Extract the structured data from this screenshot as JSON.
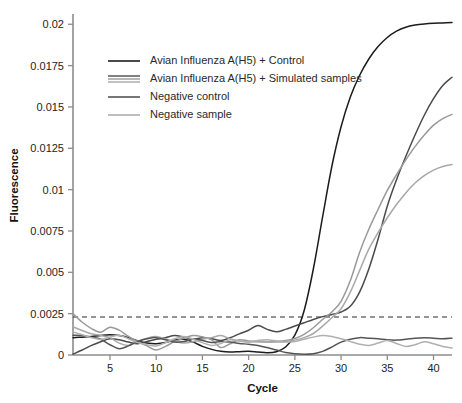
{
  "chart_data": {
    "type": "line",
    "title": "",
    "xlabel": "Cycle",
    "ylabel": "Fluorescence",
    "xlim": [
      1,
      42
    ],
    "ylim": [
      0,
      0.0205
    ],
    "xticks": [
      5,
      10,
      15,
      20,
      25,
      30,
      35,
      40
    ],
    "yticks": [
      0,
      0.0025,
      0.005,
      0.0075,
      0.01,
      0.0125,
      0.015,
      0.0175,
      0.02
    ],
    "ytick_labels": [
      "0",
      "0.0025",
      "0.005",
      "0.0075",
      "0.01",
      "0.0125",
      "0.015",
      "0.0175",
      "0.02"
    ],
    "xtick_labels": [
      "5",
      "10",
      "15",
      "20",
      "25",
      "30",
      "35",
      "40"
    ],
    "grid": false,
    "legend_position": "upper-left-inside",
    "threshold": {
      "label": "threshold",
      "value": 0.0023,
      "style": "dashed",
      "color": "#2b2b2b"
    },
    "x": [
      1,
      2,
      3,
      4,
      5,
      6,
      7,
      8,
      9,
      10,
      11,
      12,
      13,
      14,
      15,
      16,
      17,
      18,
      19,
      20,
      21,
      22,
      23,
      24,
      25,
      26,
      27,
      28,
      29,
      30,
      31,
      32,
      33,
      34,
      35,
      36,
      37,
      38,
      39,
      40,
      41,
      42
    ],
    "series": [
      {
        "name": "Avian Influenza A(H5) + Control",
        "group": "positive-control",
        "color": "#1c1c1c",
        "values": [
          0.00105,
          0.00108,
          0.00112,
          0.00118,
          0.00122,
          0.00118,
          0.00105,
          0.00085,
          0.00072,
          0.00068,
          0.00075,
          0.0009,
          0.00095,
          0.00078,
          0.00052,
          0.00034,
          0.00022,
          0.00018,
          0.0002,
          0.00022,
          0.00018,
          0.00014,
          0.0002,
          0.00048,
          0.0012,
          0.00268,
          0.0052,
          0.00835,
          0.0114,
          0.0138,
          0.0156,
          0.0169,
          0.0179,
          0.01865,
          0.0192,
          0.01958,
          0.01982,
          0.01995,
          0.02002,
          0.02006,
          0.02008,
          0.0201
        ]
      },
      {
        "name": "Avian Influenza A(H5) + Simulated sample 1",
        "group": "simulated-samples",
        "color": "#4a4a4a",
        "values": [
          5e-05,
          0.0003,
          0.00058,
          0.0008,
          0.00098,
          0.00092,
          0.00078,
          0.00068,
          0.00082,
          0.00095,
          0.00105,
          0.00118,
          0.00108,
          0.00095,
          0.00105,
          0.00098,
          0.00088,
          0.00105,
          0.00128,
          0.0015,
          0.00178,
          0.00155,
          0.0014,
          0.00155,
          0.00175,
          0.00195,
          0.00215,
          0.00232,
          0.00245,
          0.0026,
          0.00295,
          0.0038,
          0.0052,
          0.007,
          0.009,
          0.0106,
          0.012,
          0.0133,
          0.0145,
          0.0155,
          0.0163,
          0.0168
        ]
      },
      {
        "name": "Avian Influenza A(H5) + Simulated sample 2",
        "group": "simulated-samples",
        "color": "#9a9a9a",
        "values": [
          0.0025,
          0.00198,
          0.0016,
          0.00138,
          0.00168,
          0.0015,
          0.00112,
          0.0008,
          0.00055,
          0.0003,
          0.00052,
          0.00082,
          0.00102,
          0.00118,
          0.0011,
          0.00092,
          0.00045,
          0.00068,
          0.00092,
          0.00085,
          0.0008,
          0.00078,
          0.00082,
          0.00088,
          0.001,
          0.00125,
          0.00165,
          0.00215,
          0.0026,
          0.00325,
          0.0045,
          0.0062,
          0.0076,
          0.0088,
          0.00995,
          0.0109,
          0.0118,
          0.0126,
          0.0133,
          0.0139,
          0.0143,
          0.01455
        ]
      },
      {
        "name": "Avian Influenza A(H5) + Simulated sample 3",
        "group": "simulated-samples",
        "color": "#a8a8a8",
        "values": [
          0.0017,
          0.00148,
          0.00128,
          0.00118,
          0.00105,
          0.00072,
          0.00058,
          0.00082,
          0.00102,
          0.00112,
          0.00098,
          0.00082,
          0.00072,
          0.0008,
          0.00095,
          0.00105,
          0.00118,
          0.00098,
          0.00085,
          0.00078,
          0.00082,
          0.0008,
          0.00078,
          0.00082,
          0.0009,
          0.00105,
          0.0013,
          0.00175,
          0.00225,
          0.0028,
          0.0038,
          0.0051,
          0.0064,
          0.0074,
          0.0083,
          0.0091,
          0.0098,
          0.0104,
          0.01085,
          0.01118,
          0.0114,
          0.01152
        ]
      },
      {
        "name": "Negative control",
        "group": "negative-control",
        "color": "#555555",
        "values": [
          0.0012,
          0.00118,
          0.00108,
          0.00095,
          0.00062,
          0.00038,
          0.00055,
          0.00082,
          0.00098,
          0.00105,
          0.00092,
          0.00078,
          0.00082,
          0.00095,
          0.00088,
          0.00075,
          0.00082,
          0.00078,
          0.0007,
          0.00065,
          0.00058,
          0.00045,
          0.0003,
          0.00015,
          8e-05,
          5e-05,
          8e-05,
          0.00022,
          0.00048,
          0.00078,
          0.00095,
          0.00105,
          0.00102,
          0.00098,
          0.00092,
          0.0009,
          0.00095,
          0.00102,
          0.00105,
          0.00102,
          0.00098,
          0.00102
        ]
      },
      {
        "name": "Negative sample",
        "group": "negative-sample",
        "color": "#b0b0b0",
        "values": [
          0.0014,
          0.00122,
          0.00105,
          0.00095,
          0.00108,
          0.0012,
          0.00098,
          0.00075,
          0.00062,
          0.00055,
          0.00075,
          0.00098,
          0.00112,
          0.00095,
          0.00075,
          0.00058,
          0.0007,
          0.00092,
          0.00085,
          0.0008,
          0.00088,
          0.00092,
          0.00085,
          0.00078,
          0.00082,
          0.00095,
          0.00108,
          0.00118,
          0.00112,
          0.00098,
          0.00082,
          0.00065,
          0.00058,
          0.00072,
          0.00088,
          0.0007,
          0.00052,
          0.00062,
          0.0008,
          0.00068,
          0.00052,
          0.00042
        ]
      }
    ],
    "legend": [
      {
        "label": "Avian Influenza A(H5) + Control",
        "swatch": "single-line",
        "color": "#1c1c1c"
      },
      {
        "label": "Avian Influenza A(H5) + Simulated samples",
        "swatch": "triple-line",
        "colors": [
          "#4a4a4a",
          "#9a9a9a",
          "#a8a8a8"
        ]
      },
      {
        "label": "Negative control",
        "swatch": "single-line",
        "color": "#555555"
      },
      {
        "label": "Negative sample",
        "swatch": "single-line",
        "color": "#b0b0b0"
      }
    ]
  }
}
